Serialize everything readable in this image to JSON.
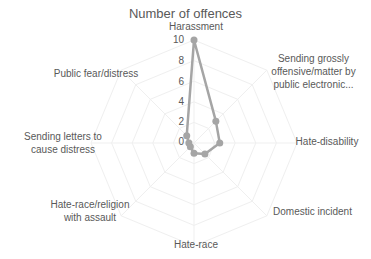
{
  "chart_data": {
    "type": "radar",
    "title": "Number of offences",
    "categories": [
      "Harassment",
      "Sending grossly offensive/matter by public electronic...",
      "Hate-disability",
      "Domestic incident",
      "Hate-race",
      "Hate-race/religion with assault",
      "Sending letters to cause distress",
      "Public fear/distress"
    ],
    "series": [
      {
        "name": "Number of offences",
        "values": [
          10,
          3,
          2.5,
          1.5,
          1,
          0.5,
          0.5,
          1
        ],
        "color": "#a5a5a5"
      }
    ],
    "rticks": [
      0,
      2,
      4,
      6,
      8,
      10
    ],
    "rlim": [
      0,
      10
    ],
    "grid": true,
    "legend": "none"
  },
  "labels": {
    "title": "Number of offences",
    "cat0": "Harassment",
    "cat1a": "Sending grossly",
    "cat1b": "offensive/matter by",
    "cat1c": "public electronic...",
    "cat2": "Hate-disability",
    "cat3": "Domestic incident",
    "cat4": "Hate-race",
    "cat5a": "Hate-race/religion",
    "cat5b": "with assault",
    "cat6a": "Sending letters to",
    "cat6b": "cause distress",
    "cat7": "Public fear/distress",
    "t0": "0",
    "t2": "2",
    "t4": "4",
    "t6": "6",
    "t8": "8",
    "t10": "10"
  }
}
